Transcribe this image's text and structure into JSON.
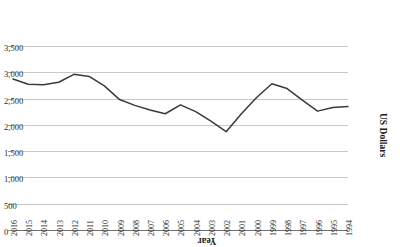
{
  "chart_data": {
    "type": "line",
    "title": "",
    "xlabel": "Year",
    "ylabel": "US Dollars",
    "orientation": "rotated-180",
    "grid": true,
    "legend": "none",
    "ylim": [
      0,
      3500
    ],
    "yticks": [
      0,
      500,
      1000,
      1500,
      2000,
      2500,
      3000,
      3500
    ],
    "ytick_labels": [
      "0",
      "500",
      "1,000",
      "1,500",
      "2,000",
      "2,500",
      "3,000",
      "3,500"
    ],
    "y_axis_inverted": true,
    "x_axis_reversed": true,
    "categories": [
      "2016",
      "2015",
      "2014",
      "2013",
      "2012",
      "2011",
      "2010",
      "2009",
      "2008",
      "2007",
      "2006",
      "2005",
      "2004",
      "2003",
      "2002",
      "2001",
      "2000",
      "1999",
      "1998",
      "1997",
      "1996",
      "1995",
      "1994"
    ],
    "values": [
      2890,
      2790,
      2780,
      2830,
      2980,
      2940,
      2760,
      2500,
      2390,
      2300,
      2230,
      2400,
      2270,
      2090,
      1890,
      2230,
      2540,
      2800,
      2710,
      2490,
      2280,
      2350,
      2370
    ],
    "series": [
      {
        "name": "US Dollars",
        "color": "#3a3a3a",
        "values": [
          2890,
          2790,
          2780,
          2830,
          2980,
          2940,
          2760,
          2500,
          2390,
          2300,
          2230,
          2400,
          2270,
          2090,
          1890,
          2230,
          2540,
          2800,
          2710,
          2490,
          2280,
          2350,
          2370
        ]
      }
    ]
  },
  "axes": {
    "x_title": "Year",
    "y_title": "US Dollars"
  },
  "colors": {
    "line": "#3a3a3a",
    "grid": "#c9c9c9",
    "axis": "#6f6f6f",
    "text": "#2b2b2b",
    "background": "#ffffff"
  }
}
